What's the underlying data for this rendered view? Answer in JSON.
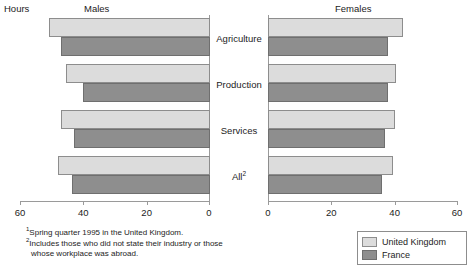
{
  "labels": {
    "hours": "Hours",
    "males": "Males",
    "females": "Females"
  },
  "categories": [
    "Agriculture",
    "Production",
    "Services",
    "All"
  ],
  "category_display": [
    {
      "text": "Agriculture",
      "sup": ""
    },
    {
      "text": "Production",
      "sup": ""
    },
    {
      "text": "Services",
      "sup": ""
    },
    {
      "text": "All",
      "sup": "2"
    }
  ],
  "axes": {
    "males_ticks": [
      "60",
      "40",
      "20",
      "0"
    ],
    "females_ticks": [
      "0",
      "20",
      "40",
      "60"
    ]
  },
  "legend": {
    "items": [
      {
        "label": "United Kingdom",
        "color": "#dcdcdc"
      },
      {
        "label": "France",
        "color": "#8e8e8e"
      }
    ]
  },
  "footnotes": [
    {
      "marker": "1",
      "text": "Spring quarter 1995 in the United Kingdom.",
      "indent": false
    },
    {
      "marker": "2",
      "text": "Includes those who did not state their industry or those",
      "indent": false
    },
    {
      "marker": "",
      "text": "whose workplace was abroad.",
      "indent": true
    }
  ],
  "chart_data": {
    "type": "bar",
    "title": "Hours",
    "orientation": "horizontal",
    "panels": [
      {
        "name": "Males",
        "direction": "right-to-left",
        "xlabel": "Hours",
        "xlim": [
          0,
          60
        ],
        "ticks": [
          60,
          40,
          20,
          0
        ],
        "categories": [
          "Agriculture",
          "Production",
          "Services",
          "All"
        ],
        "series": [
          {
            "name": "United Kingdom",
            "color": "#dcdcdc",
            "values": [
              51,
              45.5,
              47,
              48
            ]
          },
          {
            "name": "France",
            "color": "#8e8e8e",
            "values": [
              47,
              40,
              43,
              43.5
            ]
          }
        ]
      },
      {
        "name": "Females",
        "direction": "left-to-right",
        "xlabel": "Hours",
        "xlim": [
          0,
          60
        ],
        "ticks": [
          0,
          20,
          40,
          60
        ],
        "categories": [
          "Agriculture",
          "Production",
          "Services",
          "All"
        ],
        "series": [
          {
            "name": "United Kingdom",
            "color": "#dcdcdc",
            "values": [
              42.5,
              40.5,
              40,
              39.5
            ]
          },
          {
            "name": "France",
            "color": "#8e8e8e",
            "values": [
              38,
              38,
              37,
              36
            ]
          }
        ]
      }
    ],
    "ylabel": "",
    "grid": false,
    "legend_position": "bottom-right"
  }
}
